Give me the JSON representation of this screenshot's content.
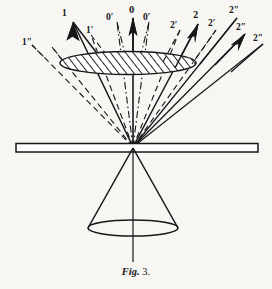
{
  "figure": {
    "caption_prefix": "Fig.",
    "caption_number": "3.",
    "background_color": "#f7f6f3",
    "ink_color": "#17171a",
    "apex": {
      "x": 133,
      "y": 147
    },
    "plate": {
      "x": 16,
      "y": 143,
      "width": 242,
      "height": 9
    },
    "hatched_disc": {
      "cx": 128,
      "cy": 63,
      "rx": 68,
      "ry": 11.5,
      "hatch_direction": "forward-slash"
    },
    "lower_cone": {
      "apex_x": 133,
      "apex_y": 148,
      "base_cx": 133,
      "base_cy": 228,
      "base_rx": 45,
      "base_ry": 8
    }
  },
  "rays": [
    {
      "id": "ray-1-double-prime",
      "label": "1″",
      "style": "dashed",
      "arrow": false,
      "label_x": 22,
      "label_y": 38
    },
    {
      "id": "ray-1",
      "label": "1",
      "style": "solid",
      "arrow": true,
      "label_x": 62,
      "label_y": 9
    },
    {
      "id": "ray-1-prime",
      "label": "1′",
      "style": "dashed",
      "arrow": false,
      "label_x": 86,
      "label_y": 26
    },
    {
      "id": "ray-0-prime-left",
      "label": "0′",
      "style": "dash-dot",
      "arrow": false,
      "label_x": 110,
      "label_y": 13
    },
    {
      "id": "ray-0",
      "label": "0",
      "style": "solid",
      "arrow": true,
      "label_x": 129,
      "label_y": 6
    },
    {
      "id": "ray-0-prime-right",
      "label": "0′",
      "style": "dash-dot",
      "arrow": false,
      "label_x": 143,
      "label_y": 13
    },
    {
      "id": "ray-2-prime-left",
      "label": "2′",
      "style": "dashed",
      "arrow": false,
      "label_x": 172,
      "label_y": 21
    },
    {
      "id": "ray-2",
      "label": "2",
      "style": "solid",
      "arrow": true,
      "label_x": 193,
      "label_y": 11
    },
    {
      "id": "ray-2-prime-right",
      "label": "2′",
      "style": "dashed",
      "arrow": false,
      "label_x": 208,
      "label_y": 20
    },
    {
      "id": "ray-2-double-prime-a",
      "label": "2″",
      "style": "solid",
      "arrow": false,
      "label_x": 230,
      "label_y": 7
    },
    {
      "id": "ray-2-double-prime-b",
      "label": "2″",
      "style": "solid",
      "arrow": true,
      "label_x": 236,
      "label_y": 24
    },
    {
      "id": "ray-2-double-prime-c",
      "label": "2″",
      "style": "solid",
      "arrow": false,
      "label_x": 254,
      "label_y": 35
    }
  ]
}
